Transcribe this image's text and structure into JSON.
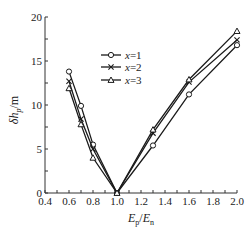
{
  "chart_data": {
    "type": "line",
    "title": "",
    "xlabel": "Ep/En",
    "xlabel_parts": {
      "E1": "E",
      "sub1": "p",
      "sep": "/",
      "E2": "E",
      "sub2": "n"
    },
    "ylabel": "δhp/m",
    "ylabel_parts": {
      "delta": "δ",
      "h": "h",
      "sub": "p",
      "unit": "/m"
    },
    "xlim": [
      0.4,
      2.0
    ],
    "ylim": [
      0,
      20
    ],
    "x_ticks": [
      0.4,
      0.6,
      0.8,
      1.0,
      1.2,
      1.4,
      1.6,
      1.8,
      2.0
    ],
    "x_tick_labels": [
      "0.4",
      "0.6",
      "0.8",
      "1.0",
      "1.2",
      "1.4",
      "1.6",
      "1.8",
      "2.0"
    ],
    "y_ticks": [
      0,
      5,
      10,
      15,
      20
    ],
    "y_tick_labels": [
      "0",
      "5",
      "10",
      "15",
      "20"
    ],
    "grid": false,
    "legend_position": "upper-left-center",
    "series": [
      {
        "name": "x=1",
        "marker": "circle",
        "x": [
          0.6,
          0.7,
          0.8,
          1.0,
          1.3,
          1.6,
          2.0
        ],
        "y": [
          13.8,
          9.9,
          5.5,
          0,
          5.4,
          11.2,
          16.8
        ]
      },
      {
        "name": "x=2",
        "marker": "cross",
        "x": [
          0.6,
          0.7,
          0.8,
          1.0,
          1.3,
          1.6,
          2.0
        ],
        "y": [
          12.7,
          8.4,
          5.0,
          0,
          6.8,
          12.6,
          17.4
        ]
      },
      {
        "name": "x=3",
        "marker": "triangle",
        "x": [
          0.6,
          0.7,
          0.8,
          1.0,
          1.3,
          1.6,
          2.0
        ],
        "y": [
          11.9,
          7.8,
          4.0,
          0,
          7.2,
          12.9,
          18.4
        ]
      }
    ],
    "legend": [
      {
        "label_var": "x",
        "label_val": "=1",
        "marker": "circle"
      },
      {
        "label_var": "x",
        "label_val": "=2",
        "marker": "cross"
      },
      {
        "label_var": "x",
        "label_val": "=3",
        "marker": "triangle"
      }
    ]
  },
  "colors": {
    "line": "#1a1a1a",
    "axis": "#333333",
    "background": "#ffffff"
  }
}
